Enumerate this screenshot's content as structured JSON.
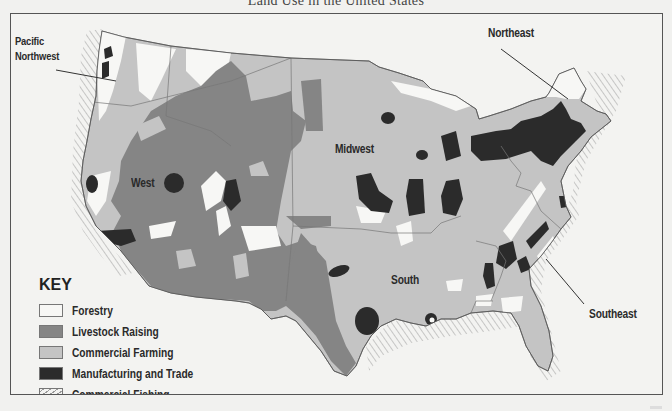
{
  "title": "Land Use in the United States",
  "region_labels": {
    "pacific_northwest": "Pacific\nNorthwest",
    "pacific_northwest_line1": "Pacific",
    "pacific_northwest_line2": "Northwest",
    "west": "West",
    "midwest": "Midwest",
    "northeast": "Northeast",
    "south": "South",
    "southeast": "Southeast"
  },
  "key": {
    "title": "KEY",
    "items": [
      {
        "label": "Forestry",
        "color": "#f7f7f5",
        "pattern": "solid"
      },
      {
        "label": "Livestock Raising",
        "color": "#858585",
        "pattern": "solid"
      },
      {
        "label": "Commercial Farming",
        "color": "#c4c4c4",
        "pattern": "solid"
      },
      {
        "label": "Manufacturing and Trade",
        "color": "#2b2b2b",
        "pattern": "solid"
      },
      {
        "label": "Commercial Fishing",
        "color": "#f3f3f1",
        "pattern": "hatched"
      }
    ]
  },
  "colors": {
    "forestry": "#f7f7f5",
    "livestock": "#858585",
    "farming": "#c4c4c4",
    "manufacturing": "#2b2b2b",
    "border": "#555555",
    "background": "#f3f3f1"
  }
}
